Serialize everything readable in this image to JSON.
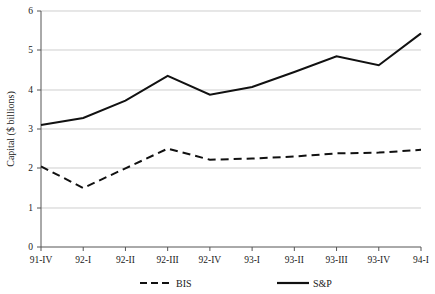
{
  "chart_data": {
    "type": "line",
    "title": "",
    "xlabel": "",
    "ylabel": "Capital ($ billions)",
    "categories": [
      "91-IV",
      "92-I",
      "92-II",
      "92-III",
      "92-IV",
      "93-I",
      "93-II",
      "93-III",
      "93-IV",
      "94-I"
    ],
    "series": [
      {
        "name": "BIS",
        "style": "dashed",
        "color": "#111111",
        "values": [
          2.05,
          1.5,
          2.0,
          2.5,
          2.22,
          2.25,
          2.3,
          2.38,
          2.4,
          2.47
        ]
      },
      {
        "name": "S&P",
        "style": "solid",
        "color": "#111111",
        "values": [
          3.1,
          3.28,
          3.72,
          4.35,
          3.87,
          4.07,
          4.45,
          4.85,
          4.62,
          5.43
        ]
      }
    ],
    "ylim": [
      0,
      6
    ],
    "yticks": [
      "0",
      "1",
      "2",
      "3",
      "4",
      "5",
      "6"
    ],
    "grid": true,
    "legend_position": "bottom"
  },
  "legend": {
    "items": [
      {
        "label": "BIS",
        "style": "dashed"
      },
      {
        "label": "S&P",
        "style": "solid"
      }
    ]
  }
}
